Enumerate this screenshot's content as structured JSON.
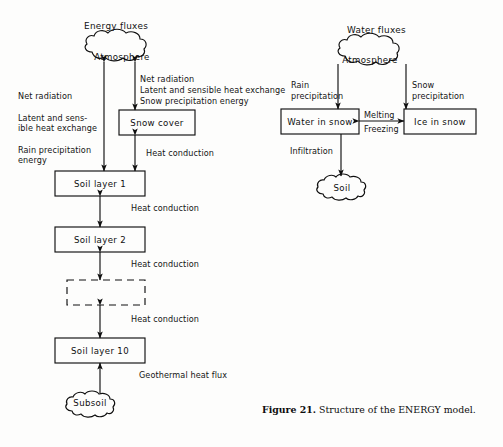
{
  "figure": {
    "caption_label": "Figure 21.",
    "caption_text": " Structure of the ENERGY model.",
    "ink_color": "#101010",
    "background_color": "#fdfdfc"
  },
  "panels": {
    "energy": {
      "title": "Energy fluxes",
      "nodes": {
        "atmosphere": "Atmosphere",
        "snow_cover": "Snow cover",
        "soil_layer_1": "Soil layer 1",
        "soil_layer_2": "Soil layer 2",
        "soil_layer_dashed": "",
        "soil_layer_10": "Soil layer 10",
        "subsoil": "Subsoil"
      },
      "edge_labels": {
        "left_flux_line1": "Net radiation",
        "left_flux_line2": "Latent and sens-",
        "left_flux_line3": "ible heat exchange",
        "left_flux_line4": "Rain precipitation",
        "left_flux_line5": "energy",
        "snow_flux_line1": "Net radiation",
        "snow_flux_line2": "Latent and sensible heat exchange",
        "snow_flux_line3": "Snow precipitation energy",
        "heat_conduction_snow": "Heat conduction",
        "heat_conduction_1_2": "Heat conduction",
        "heat_conduction_2_dash": "Heat conduction",
        "heat_conduction_dash_10": "Heat conduction",
        "geothermal": "Geothermal heat flux"
      }
    },
    "water": {
      "title": "Water fluxes",
      "nodes": {
        "atmosphere": "Atmosphere",
        "water_in_snow": "Water in snow",
        "ice_in_snow": "Ice in snow",
        "soil": "Soil"
      },
      "edge_labels": {
        "rain_line1": "Rain",
        "rain_line2": "precipitation",
        "snow_line1": "Snow",
        "snow_line2": "precipitation",
        "melting": "Melting",
        "freezing": "Freezing",
        "infiltration": "Infiltration"
      }
    }
  }
}
